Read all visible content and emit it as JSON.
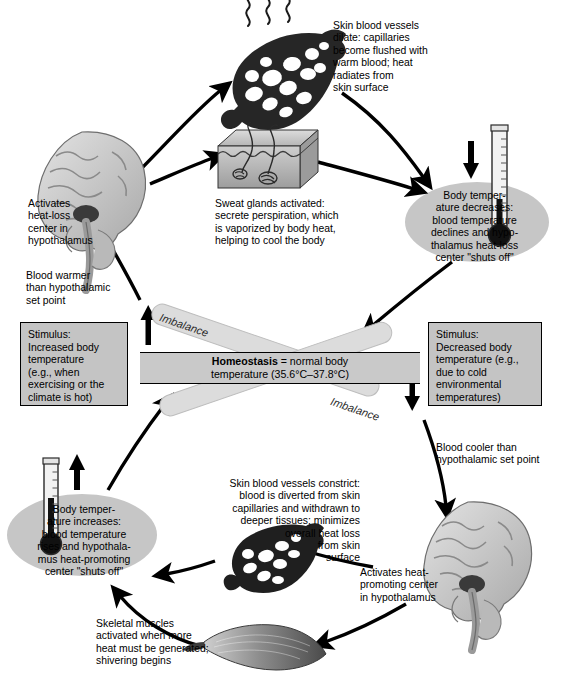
{
  "diagram": {
    "center": {
      "homeostasis_label": "Homeostasis",
      "homeostasis_text": " = normal body\ntemperature (35.6°C–37.8°C)",
      "imbalance_top": "Imbalance",
      "imbalance_bottom": "Imbalance"
    },
    "stimulus_left": "Stimulus:\nIncreased body\ntemperature\n(e.g., when\nexercising or the\nclimate is hot)",
    "stimulus_right": "Stimulus:\nDecreased body\ntemperature (e.g.,\ndue to cold\nenvironmental\ntemperatures)",
    "heat_loss_loop": {
      "blood_warmer": "Blood warmer\nthan hypothalamic\nset point",
      "activates_center": "Activates\nheat-loss\ncenter in\nhypothalamus",
      "vessels_dilate": "Skin blood vessels\ndilate: capillaries\nbecome flushed with\nwarm blood; heat\nradiates from\nskin surface",
      "sweat_glands": "Sweat glands activated:\nsecrete perspiration, which\nis vaporized by body heat,\nhelping to cool the body",
      "temperature_decreases": "Body temper-\nature decreases:\nblood temperature\ndeclines and hypo-\nthalamus heat-loss\ncenter \"shuts off\""
    },
    "heat_promoting_loop": {
      "blood_cooler": "Blood cooler than\nhypothalamic set point",
      "activates_center": "Activates heat-\npromoting center\nin hypothalamus",
      "vessels_constrict": "Skin blood vessels constrict:\nblood is diverted from skin\ncapillaries and withdrawn to\ndeeper tissues; minimizes\noverall heat loss\nfrom skin\nsurface",
      "skeletal_muscles": "Skeletal muscles\nactivated when more\nheat must be generated;\nshivering begins",
      "temperature_increases": "Body temper-\nature increases:\nblood temperature\nrises and hypothala-\nmus heat-promoting\ncenter \"shuts off\""
    },
    "icons": {
      "thermometer_down": "thermometer-falling-icon",
      "thermometer_up": "thermometer-rising-icon",
      "brain_heat_loss": "brain-sagittal-icon",
      "brain_heat_promoting": "brain-sagittal-icon",
      "capillary_dilated": "capillary-bed-dilated-icon",
      "capillary_constricted": "capillary-bed-constricted-icon",
      "skin_block": "skin-cross-section-icon",
      "muscle": "skeletal-muscle-icon",
      "heat_waves": "heat-radiation-icon"
    },
    "colors": {
      "box_fill": "#c4c4c4",
      "oval_fill": "#c6c6c6",
      "ribbon_fill": "#dcdcdc",
      "bar_fill": "#c9c9c9",
      "line": "#000000"
    }
  }
}
